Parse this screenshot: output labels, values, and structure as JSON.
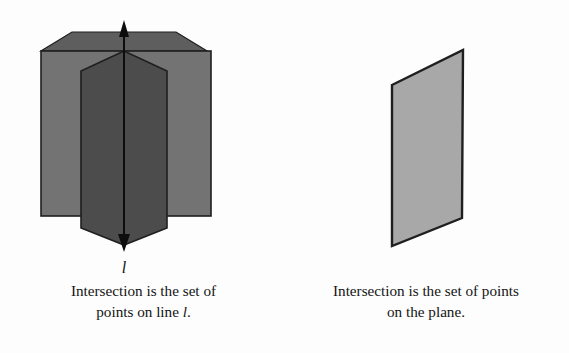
{
  "figure": {
    "background_color": "#fdfdfd",
    "stroke_color": "#1a1a1a",
    "left_diagram": {
      "name": "three-planes-intersecting-in-a-line",
      "line_label": "l",
      "colors": {
        "back_plane": "#737373",
        "front_plane": "#4c4c4c",
        "wedge": "#5a5a5a"
      },
      "description": "Three planes intersecting in a common line",
      "line_arrow_top": "up-arrow",
      "line_arrow_bottom": "down-arrow"
    },
    "right_diagram": {
      "name": "single-plane",
      "colors": {
        "plane": "#a8a8a8"
      },
      "description": "A single plane drawn as a parallelogram"
    }
  },
  "captions": {
    "left": {
      "line1": "Intersection is the set of",
      "line2_prefix": "points on line ",
      "line2_variable": "l",
      "line2_suffix": "."
    },
    "right": {
      "line1": "Intersection is the set of points",
      "line2": "on the plane."
    }
  }
}
